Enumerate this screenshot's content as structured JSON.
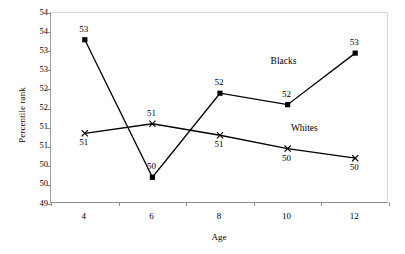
{
  "chart_data": {
    "type": "line",
    "title": "",
    "xlabel": "Age",
    "ylabel": "Percentile rank",
    "x": [
      4,
      6,
      8,
      10,
      12
    ],
    "xticklabels": [
      "4",
      "6",
      "8",
      "10",
      "12"
    ],
    "yticklabels": [
      "54",
      "54",
      "53",
      "53",
      "52",
      "52",
      "51",
      "51",
      "50",
      "50",
      "49"
    ],
    "ylim": [
      49,
      54
    ],
    "grid": false,
    "legend_position": "inline-annotations",
    "series": [
      {
        "name": "Blacks",
        "marker": "square",
        "values": [
          53.3,
          49.7,
          51.9,
          51.6,
          52.95
        ],
        "point_labels": [
          "53",
          "50",
          "52",
          "52",
          "53"
        ],
        "label_positions": [
          "above",
          "above",
          "above",
          "above",
          "above"
        ]
      },
      {
        "name": "Whites",
        "marker": "x",
        "values": [
          50.85,
          51.1,
          50.8,
          50.45,
          50.2
        ],
        "point_labels": [
          "51",
          "51",
          "51",
          "50",
          "50"
        ],
        "label_positions": [
          "below",
          "above",
          "below",
          "below",
          "below"
        ]
      }
    ],
    "annotations": [
      {
        "text": "Blacks",
        "x": 10.0,
        "y": 52.7
      },
      {
        "text": "Whites",
        "x": 10.6,
        "y": 50.95
      }
    ]
  },
  "footer": {
    "clipped_text": ""
  }
}
